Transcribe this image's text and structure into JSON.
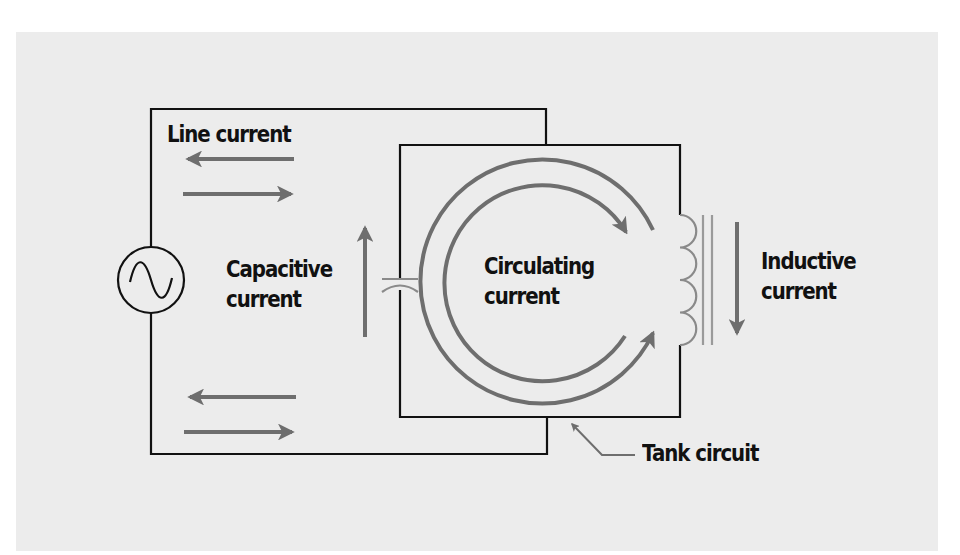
{
  "diagram": {
    "labels": {
      "line_current": "Line current",
      "capacitive": {
        "line1": "Capacitive",
        "line2": "current"
      },
      "circulating": {
        "line1": "Circulating",
        "line2": "current"
      },
      "inductive": {
        "line1": "Inductive",
        "line2": "current"
      },
      "tank_circuit": "Tank circuit"
    },
    "components": [
      {
        "id": "ac-source",
        "symbol": "sine-wave-in-circle"
      },
      {
        "id": "capacitor",
        "symbol": "capacitor"
      },
      {
        "id": "inductor",
        "symbol": "coil-with-iron-core"
      }
    ],
    "colors": {
      "background": "#ffffff",
      "panel": "#ececec",
      "wire": "#111111",
      "arrow": "#6e6e6e",
      "component": "#8a8a8a",
      "text": "#111111"
    }
  }
}
